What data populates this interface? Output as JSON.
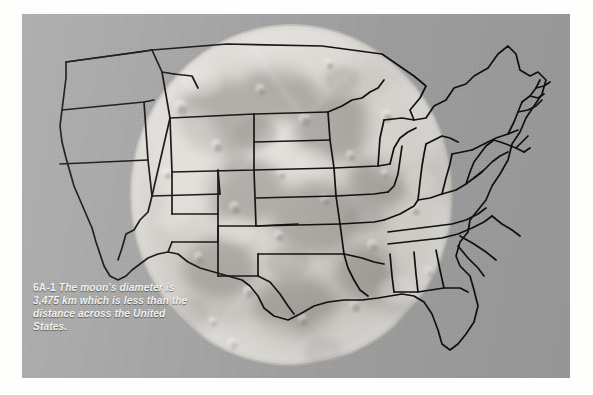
{
  "figure": {
    "number_label": "6A-1",
    "caption_text": "The moon's diameter is 3,475 km which is less than the distance across the United States.",
    "caption_full": "6A-1 The moon's diameter is 3,475 km which is less than the distance across the United States.",
    "moon_diameter_km": "3,475 km",
    "alt_description": "Outline map of the contiguous United States overlaid on a full-moon photograph, showing the moon's disc is narrower than the country is wide.",
    "subject": "moon",
    "overlay_subject": "United States"
  },
  "colors": {
    "page_background": "#fdfdfb",
    "plate_background": "#a8a8a8",
    "moon_light": "#e9e7e2",
    "moon_mid": "#cfcdc8",
    "moon_dark": "#a9a7a2",
    "map_outline": "#111111",
    "caption_text": "#f2f2f0"
  },
  "layout": {
    "image_width": 593,
    "image_height": 395,
    "plate": {
      "x": 22,
      "y": 14,
      "width": 548,
      "height": 364
    },
    "moon_disc": {
      "center_x": 292,
      "center_y": 196,
      "radius_x": 164,
      "radius_y": 173
    }
  },
  "icons": {
    "moon": "full-moon-icon",
    "map": "usa-outline-map-icon"
  }
}
